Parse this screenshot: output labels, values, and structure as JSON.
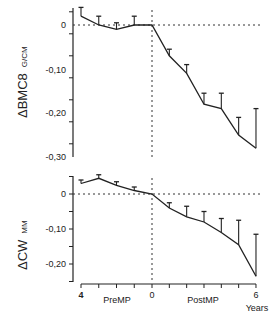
{
  "chart_data": [
    {
      "type": "line",
      "title": "",
      "ylabel": "Δ BMC8 G/CM",
      "xlabel": "Years",
      "x": [
        -4,
        -3,
        -2,
        -1,
        0,
        1,
        2,
        3,
        4,
        5,
        6
      ],
      "values": [
        0.02,
        0.0,
        -0.01,
        0.0,
        0.0,
        -0.07,
        -0.11,
        -0.18,
        -0.19,
        -0.25,
        -0.28
      ],
      "error_up": [
        0.02,
        0.02,
        0.015,
        0.02,
        0.0,
        0.015,
        0.02,
        0.025,
        0.035,
        0.04,
        0.09
      ],
      "ylim": [
        -0.3,
        0.03
      ],
      "yticks": [
        "0",
        "-0,10",
        "-0,20",
        "-0,30"
      ],
      "reference_lines": {
        "horizontal": 0,
        "vertical": 0
      }
    },
    {
      "type": "line",
      "title": "",
      "ylabel": "Δ CW MM",
      "xlabel": "Years",
      "x": [
        -4,
        -3,
        -2,
        -1,
        0,
        1,
        2,
        3,
        4,
        5,
        6
      ],
      "values": [
        0.03,
        0.045,
        0.025,
        0.01,
        0.0,
        -0.04,
        -0.065,
        -0.08,
        -0.11,
        -0.145,
        -0.235
      ],
      "error_up": [
        0.01,
        0.01,
        0.01,
        0.01,
        0.0,
        0.015,
        0.03,
        0.03,
        0.04,
        0.07,
        0.12
      ],
      "ylim": [
        -0.25,
        0.05
      ],
      "yticks": [
        "0",
        "-0,10",
        "-0,20"
      ],
      "reference_lines": {
        "horizontal": 0,
        "vertical": 0
      },
      "xticks": [
        "4",
        "0",
        "6"
      ],
      "xregions": [
        "PreMP",
        "PostMP"
      ]
    }
  ],
  "labels": {
    "top_ylabel_main": "ΔBMC8",
    "top_ylabel_unit": "G/CM",
    "bottom_ylabel_main": "ΔCW",
    "bottom_ylabel_unit": "MM",
    "top_yticks": [
      "0",
      "-0,10",
      "-0,20",
      "-0,30"
    ],
    "bottom_yticks": [
      "0",
      "-0,10",
      "-0,20"
    ],
    "x_left": "4",
    "x_mid": "0",
    "x_right": "6",
    "pre": "PreMP",
    "post": "PostMP",
    "years": "Years"
  }
}
